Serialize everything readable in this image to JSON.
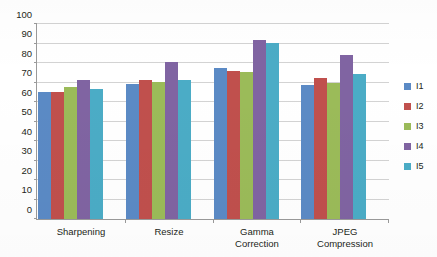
{
  "chart_data": {
    "type": "bar",
    "title": "",
    "subtitle": "",
    "xlabel": "",
    "ylabel": "",
    "ylim": [
      0,
      100
    ],
    "ytick_step": 10,
    "yticks": [
      0,
      10,
      20,
      30,
      40,
      50,
      60,
      70,
      80,
      90,
      100
    ],
    "ytick_labels": [
      "0",
      "10",
      "20",
      "30",
      "40",
      "50",
      "60",
      "70",
      "80",
      "90",
      "100"
    ],
    "grid": "horizontal",
    "legend_position": "right",
    "categories": [
      "Sharpening",
      "Resize",
      "Gamma Correction",
      "JPEG Compression"
    ],
    "category_lines": [
      [
        "Sharpening"
      ],
      [
        "Resize"
      ],
      [
        "Gamma",
        "Correction"
      ],
      [
        "JPEG",
        "Compression"
      ]
    ],
    "series": [
      {
        "name": "I1",
        "color": "#5b8ac5",
        "values": [
          65,
          69,
          77.5,
          68.5
        ]
      },
      {
        "name": "I2",
        "color": "#c0504d",
        "values": [
          65,
          71.5,
          76,
          72.5
        ]
      },
      {
        "name": "I3",
        "color": "#9bbb59",
        "values": [
          67.5,
          70.5,
          75.5,
          69.5
        ]
      },
      {
        "name": "I4",
        "color": "#8064a2",
        "values": [
          71.5,
          80.5,
          92,
          84
        ]
      },
      {
        "name": "I5",
        "color": "#4bacc6",
        "values": [
          66.5,
          71.5,
          90.5,
          74.5
        ]
      }
    ]
  },
  "legend": {
    "items": [
      {
        "label": "I1",
        "color": "#5b8ac5"
      },
      {
        "label": "I2",
        "color": "#c0504d"
      },
      {
        "label": "I3",
        "color": "#9bbb59"
      },
      {
        "label": "I4",
        "color": "#8064a2"
      },
      {
        "label": "I5",
        "color": "#4bacc6"
      }
    ]
  }
}
